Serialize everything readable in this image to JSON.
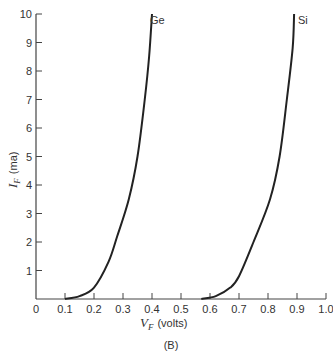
{
  "chart_data": {
    "type": "line",
    "title": "",
    "caption": "(B)",
    "xlabel": "V_F (volts)",
    "ylabel": "I_F (ma)",
    "xlim": [
      0,
      1.0
    ],
    "ylim": [
      0,
      10
    ],
    "x_ticks": [
      "0",
      "0.1",
      "0.2",
      "0.3",
      "0.4",
      "0.5",
      "0.6",
      "0.7",
      "0.8",
      "0.9",
      "1.0"
    ],
    "y_ticks": [
      "1",
      "2",
      "3",
      "4",
      "5",
      "6",
      "7",
      "8",
      "9",
      "10"
    ],
    "grid": false,
    "legend": "inline labels at curve tops",
    "series": [
      {
        "name": "Ge",
        "x": [
          0.1,
          0.15,
          0.2,
          0.25,
          0.28,
          0.32,
          0.35,
          0.375,
          0.39,
          0.4
        ],
        "y": [
          0.0,
          0.1,
          0.4,
          1.3,
          2.2,
          3.5,
          5.0,
          7.0,
          8.5,
          10.0
        ]
      },
      {
        "name": "Si",
        "x": [
          0.57,
          0.62,
          0.67,
          0.7,
          0.75,
          0.807,
          0.84,
          0.865,
          0.885,
          0.89
        ],
        "y": [
          0.0,
          0.1,
          0.4,
          0.8,
          2.0,
          3.5,
          5.0,
          7.0,
          8.8,
          10.0
        ]
      }
    ]
  },
  "labels": {
    "ge": "Ge",
    "si": "Si",
    "xlabel_main": "V",
    "xlabel_sub": "F",
    "xlabel_unit": "(volts)",
    "ylabel_main": "I",
    "ylabel_sub": "F",
    "ylabel_unit": "(ma)",
    "caption": "(B)"
  }
}
